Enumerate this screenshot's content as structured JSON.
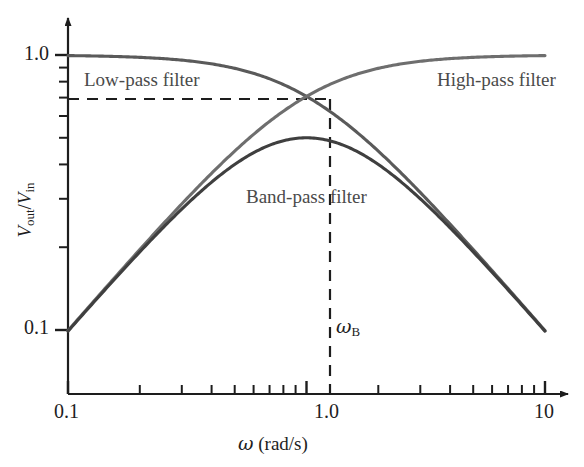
{
  "chart_data": {
    "type": "line",
    "title": "",
    "xlabel": "ω (rad/s)",
    "ylabel": "V_out/V_in",
    "xscale": "log",
    "yscale": "log",
    "xlim": [
      0.1,
      10
    ],
    "ylim": [
      0.0562,
      1.15
    ],
    "grid": false,
    "legend_position": "inline-annotations",
    "xticks": [
      {
        "value": 0.1,
        "label": "0.1"
      },
      {
        "value": 1.0,
        "label": "1.0"
      },
      {
        "value": 10,
        "label": "10"
      }
    ],
    "yticks": [
      {
        "value": 1.0,
        "label": "1.0"
      },
      {
        "value": 0.1,
        "label": "0.1"
      }
    ],
    "minor_ticks": true,
    "series": [
      {
        "name": "Low-pass filter",
        "color": "#5a5a5a",
        "formula": "1/sqrt(1+w^2)",
        "x": [
          0.1,
          0.15,
          0.22,
          0.32,
          0.46,
          0.68,
          1.0,
          1.47,
          2.15,
          3.16,
          4.64,
          6.81,
          10.0
        ],
        "values": [
          0.995,
          0.989,
          0.977,
          0.952,
          0.908,
          0.827,
          0.707,
          0.563,
          0.422,
          0.301,
          0.211,
          0.146,
          0.0995
        ]
      },
      {
        "name": "High-pass filter",
        "color": "#6e6e6e",
        "formula": "w/sqrt(1+w^2)",
        "x": [
          0.1,
          0.15,
          0.22,
          0.32,
          0.46,
          0.68,
          1.0,
          1.47,
          2.15,
          3.16,
          4.64,
          6.81,
          10.0
        ],
        "values": [
          0.0995,
          0.148,
          0.215,
          0.305,
          0.418,
          0.562,
          0.707,
          0.827,
          0.907,
          0.953,
          0.977,
          0.989,
          0.995
        ]
      },
      {
        "name": "Band-pass filter",
        "color": "#3f3f3f",
        "formula": "w/(1+w^2)",
        "x": [
          0.1,
          0.15,
          0.22,
          0.32,
          0.46,
          0.68,
          1.0,
          1.47,
          2.15,
          3.16,
          4.64,
          6.81,
          10.0
        ],
        "values": [
          0.099,
          0.1466,
          0.2095,
          0.2904,
          0.3793,
          0.465,
          0.5,
          0.4655,
          0.3824,
          0.2869,
          0.2062,
          0.1445,
          0.099
        ]
      }
    ],
    "annotations": [
      {
        "name": "crossover_frequency",
        "label": "ωB",
        "x": 1.0,
        "y": 0.707,
        "note": "breakpoint frequency marker"
      },
      {
        "name": "crossover_level",
        "value": 0.707,
        "note": "dashed horizontal line at 1/sqrt(2)"
      }
    ]
  },
  "labels": {
    "lowpass": "Low-pass filter",
    "highpass": "High-pass filter",
    "bandpass": "Band-pass filter",
    "omega_b_symbol": "ω",
    "omega_b_subscript": "B",
    "x_tick_left": "0.1",
    "x_tick_mid": "1.0",
    "x_tick_right": "10",
    "y_tick_top": "1.0",
    "y_tick_bottom": "0.1",
    "x_axis_title_symbol": "ω",
    "x_axis_title_units": " (rad/s)",
    "y_axis_title_num": "V",
    "y_axis_title_num_sub": "out",
    "y_axis_title_slash": "/",
    "y_axis_title_den": "V",
    "y_axis_title_den_sub": "in"
  },
  "colors": {
    "axis": "#1d1d1d",
    "lowpass": "#5a5a5a",
    "highpass": "#6e6e6e",
    "bandpass": "#3f3f3f",
    "dashed": "#1d1d1d",
    "background": "#ffffff"
  }
}
